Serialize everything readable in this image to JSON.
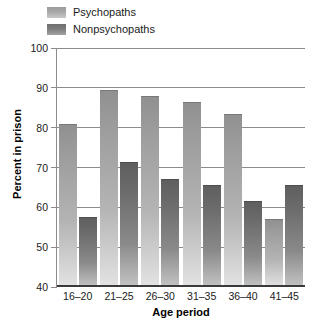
{
  "chart_data": {
    "type": "bar",
    "title": "",
    "xlabel": "Age period",
    "ylabel": "Percent in prison",
    "categories": [
      "16–20",
      "21–25",
      "26–30",
      "31–35",
      "36–40",
      "41–45"
    ],
    "series": [
      {
        "name": "Psychopaths",
        "color": "#a8a8a8",
        "values": [
          81.0,
          89.5,
          88.0,
          86.5,
          83.5,
          57.0
        ]
      },
      {
        "name": "Nonpsychopaths",
        "color": "#7d7d7d",
        "values": [
          57.5,
          71.5,
          67.0,
          65.5,
          61.5,
          65.5
        ]
      }
    ],
    "ylim": [
      40,
      100
    ],
    "yticks": [
      40,
      50,
      60,
      70,
      80,
      90,
      100
    ],
    "ytick_labels": [
      "40",
      "50",
      "60",
      "70",
      "80",
      "90",
      "100"
    ],
    "grid": true,
    "legend_position": "top-left",
    "bar_group_gap": true
  },
  "legend": {
    "items": [
      {
        "label": "Psychopaths",
        "swatch": "legend-swatch-psychopaths"
      },
      {
        "label": "Nonpsychopaths",
        "swatch": "legend-swatch-nonpsychopaths"
      }
    ]
  }
}
